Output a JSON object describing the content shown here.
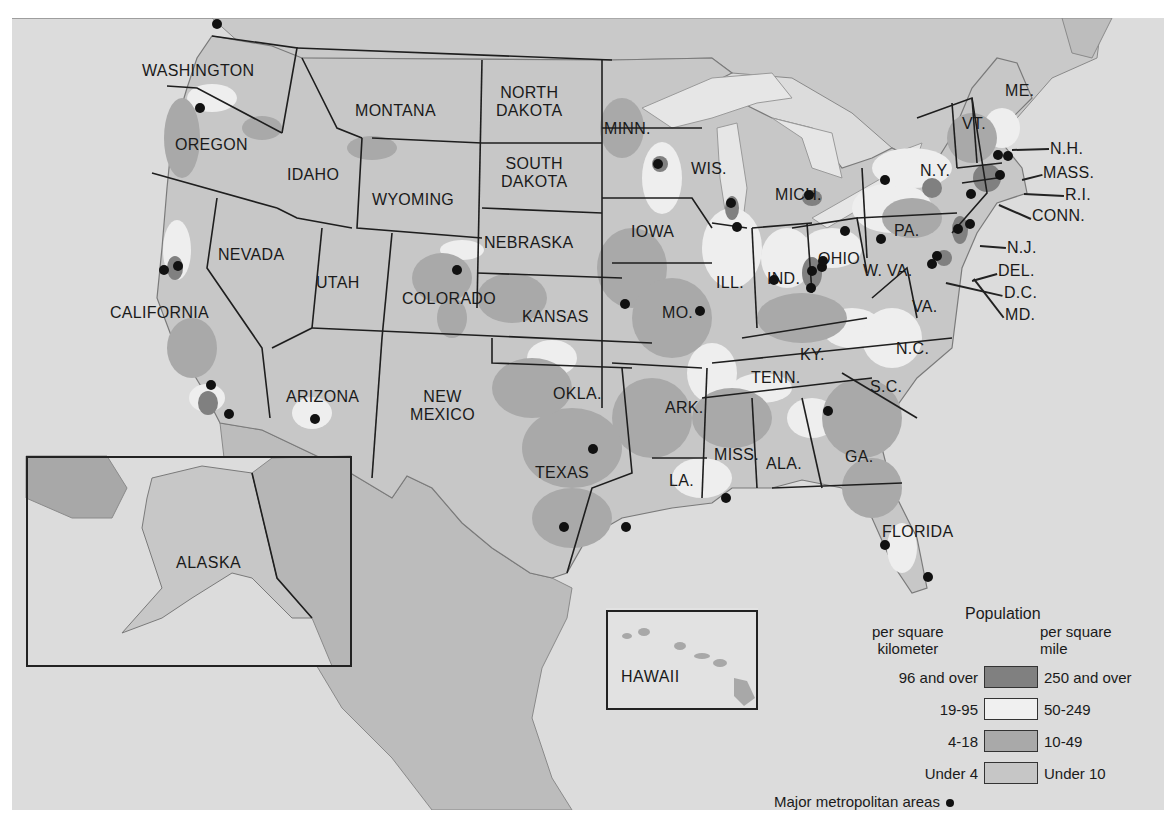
{
  "colors": {
    "background": "#ffffff",
    "ocean": "#dcdcdc",
    "land_under_4": "#c7c7c7",
    "land_4_18": "#a9a9a9",
    "land_19_95": "#eeeeee",
    "land_96_over": "#808080",
    "border": "#1e1e1e",
    "foreign_land": "#b9b9b9",
    "metro_dot": "#111111"
  },
  "states": [
    {
      "name": "WASHINGTON",
      "x": 130,
      "y": 44
    },
    {
      "name": "OREGON",
      "x": 163,
      "y": 118
    },
    {
      "name": "CALIFORNIA",
      "x": 98,
      "y": 286
    },
    {
      "name": "NEVADA",
      "x": 206,
      "y": 228
    },
    {
      "name": "IDAHO",
      "x": 275,
      "y": 148
    },
    {
      "name": "MONTANA",
      "x": 343,
      "y": 84
    },
    {
      "name": "WYOMING",
      "x": 360,
      "y": 173
    },
    {
      "name": "UTAH",
      "x": 304,
      "y": 256
    },
    {
      "name": "COLORADO",
      "x": 390,
      "y": 272
    },
    {
      "name": "ARIZONA",
      "x": 274,
      "y": 370
    },
    {
      "name": "NEW\nMEXICO",
      "x": 398,
      "y": 370
    },
    {
      "name": "NORTH\nDAKOTA",
      "x": 484,
      "y": 66
    },
    {
      "name": "SOUTH\nDAKOTA",
      "x": 489,
      "y": 137
    },
    {
      "name": "NEBRASKA",
      "x": 472,
      "y": 216
    },
    {
      "name": "KANSAS",
      "x": 510,
      "y": 290
    },
    {
      "name": "OKLA.",
      "x": 541,
      "y": 367
    },
    {
      "name": "TEXAS",
      "x": 523,
      "y": 446
    },
    {
      "name": "MINN.",
      "x": 592,
      "y": 102
    },
    {
      "name": "IOWA",
      "x": 619,
      "y": 205
    },
    {
      "name": "MO.",
      "x": 650,
      "y": 286
    },
    {
      "name": "ARK.",
      "x": 653,
      "y": 381
    },
    {
      "name": "LA.",
      "x": 657,
      "y": 454
    },
    {
      "name": "WIS.",
      "x": 679,
      "y": 142
    },
    {
      "name": "ILL.",
      "x": 704,
      "y": 256
    },
    {
      "name": "MISS.",
      "x": 702,
      "y": 428
    },
    {
      "name": "MICH.",
      "x": 763,
      "y": 168
    },
    {
      "name": "IND.",
      "x": 755,
      "y": 252
    },
    {
      "name": "OHIO",
      "x": 806,
      "y": 232
    },
    {
      "name": "KY.",
      "x": 788,
      "y": 328
    },
    {
      "name": "TENN.",
      "x": 739,
      "y": 351
    },
    {
      "name": "ALA.",
      "x": 754,
      "y": 437
    },
    {
      "name": "GA.",
      "x": 833,
      "y": 430
    },
    {
      "name": "W. VA.",
      "x": 851,
      "y": 244
    },
    {
      "name": "VA.",
      "x": 900,
      "y": 280
    },
    {
      "name": "N.C.",
      "x": 884,
      "y": 322
    },
    {
      "name": "S.C.",
      "x": 858,
      "y": 360
    },
    {
      "name": "FLORIDA",
      "x": 870,
      "y": 505
    },
    {
      "name": "PA.",
      "x": 882,
      "y": 204
    },
    {
      "name": "N.Y.",
      "x": 908,
      "y": 144
    },
    {
      "name": "VT.",
      "x": 950,
      "y": 97
    },
    {
      "name": "ME.",
      "x": 993,
      "y": 64
    }
  ],
  "callouts": [
    {
      "name": "N.H.",
      "x": 1038,
      "y": 122,
      "line": [
        1000,
        131,
        1037,
        130
      ]
    },
    {
      "name": "MASS.",
      "x": 1031,
      "y": 146,
      "line": [
        1010,
        161,
        1030,
        156
      ]
    },
    {
      "name": "R.I.",
      "x": 1053,
      "y": 168,
      "line": [
        1012,
        175,
        1052,
        177
      ]
    },
    {
      "name": "CONN.",
      "x": 1020,
      "y": 189,
      "line": [
        987,
        186,
        1019,
        200
      ]
    },
    {
      "name": "N.J.",
      "x": 995,
      "y": 221,
      "line": [
        968,
        227,
        994,
        229
      ]
    },
    {
      "name": "DEL.",
      "x": 986,
      "y": 244,
      "line": [
        960,
        262,
        985,
        255
      ]
    },
    {
      "name": "D.C.",
      "x": 992,
      "y": 266,
      "line": [
        934,
        264,
        991,
        277
      ]
    },
    {
      "name": "MD.",
      "x": 993,
      "y": 288,
      "line": [
        962,
        260,
        992,
        299
      ]
    }
  ],
  "metro_areas": [
    [
      205,
      6
    ],
    [
      188,
      90
    ],
    [
      152,
      252
    ],
    [
      166,
      248
    ],
    [
      199,
      367
    ],
    [
      217,
      396
    ],
    [
      303,
      401
    ],
    [
      445,
      252
    ],
    [
      581,
      431
    ],
    [
      613,
      286
    ],
    [
      688,
      293
    ],
    [
      646,
      146
    ],
    [
      719,
      185
    ],
    [
      725,
      209
    ],
    [
      762,
      262
    ],
    [
      797,
      177
    ],
    [
      800,
      253
    ],
    [
      810,
      249
    ],
    [
      799,
      270
    ],
    [
      811,
      243
    ],
    [
      833,
      213
    ],
    [
      873,
      162
    ],
    [
      869,
      221
    ],
    [
      946,
      211
    ],
    [
      958,
      206
    ],
    [
      925,
      238
    ],
    [
      920,
      246
    ],
    [
      986,
      137
    ],
    [
      996,
      138
    ],
    [
      988,
      157
    ],
    [
      959,
      176
    ],
    [
      816,
      393
    ],
    [
      552,
      509
    ],
    [
      614,
      509
    ],
    [
      714,
      480
    ],
    [
      873,
      527
    ],
    [
      916,
      559
    ]
  ],
  "insets": {
    "alaska": {
      "label": "ALASKA"
    },
    "hawaii": {
      "label": "HAWAII"
    }
  },
  "legend": {
    "title": "Population",
    "left_header": "per square\nkilometer",
    "right_header": "per square\nmile",
    "rows": [
      {
        "left": "96 and over",
        "right": "250 and over",
        "color": "#808080"
      },
      {
        "left": "19-95",
        "right": "50-249",
        "color": "#f0f0f0"
      },
      {
        "left": "4-18",
        "right": "10-49",
        "color": "#a9a9a9"
      },
      {
        "left": "Under 4",
        "right": "Under 10",
        "color": "#c6c6c6"
      }
    ],
    "metro_label": "Major metropolitan areas"
  }
}
